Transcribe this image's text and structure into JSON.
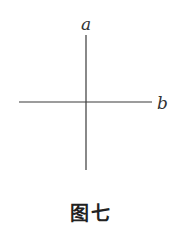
{
  "figure": {
    "lines": [
      {
        "name": "a",
        "label": "a",
        "orientation": "vertical"
      },
      {
        "name": "b",
        "label": "b",
        "orientation": "horizontal"
      }
    ],
    "relation": "perpendicular",
    "caption": "图七"
  }
}
